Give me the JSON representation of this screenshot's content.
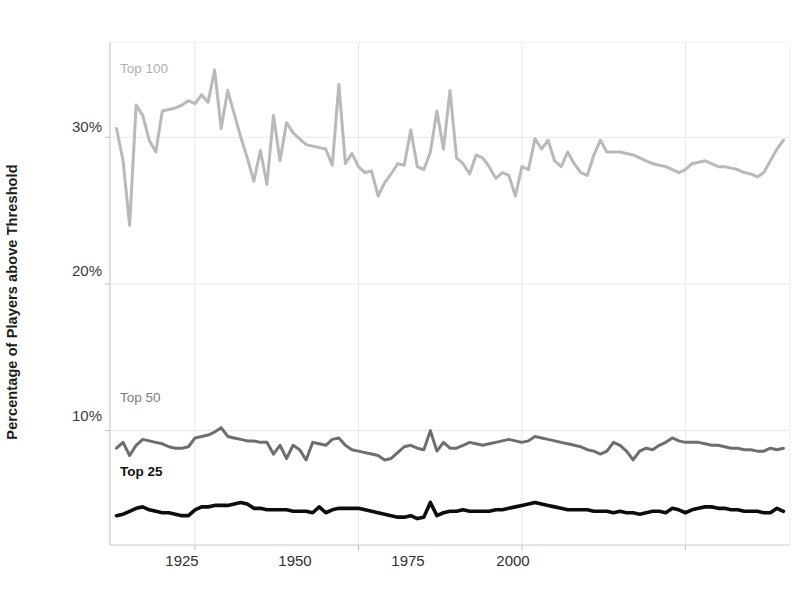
{
  "chart_data": {
    "type": "line",
    "title": "",
    "xlabel": "",
    "ylabel": "Percentage of Players above Threshold",
    "xlim": [
      1912,
      2016
    ],
    "ylim": [
      2.2,
      36.5
    ],
    "grid": true,
    "grid_axis": "both",
    "legend": "inline-labels",
    "xticks": [
      1925,
      1950,
      1975,
      2000
    ],
    "xticklabels": [
      "1925",
      "1950",
      "1975",
      "2000"
    ],
    "yticks": [
      10,
      20,
      30
    ],
    "yticklabels": [
      "10%",
      "20%",
      "30%"
    ],
    "x": [
      1913,
      1914,
      1915,
      1916,
      1917,
      1918,
      1919,
      1920,
      1921,
      1922,
      1923,
      1924,
      1925,
      1926,
      1927,
      1928,
      1929,
      1930,
      1931,
      1932,
      1933,
      1934,
      1935,
      1936,
      1937,
      1938,
      1939,
      1940,
      1941,
      1942,
      1943,
      1944,
      1945,
      1946,
      1947,
      1948,
      1949,
      1950,
      1951,
      1952,
      1953,
      1954,
      1955,
      1956,
      1957,
      1958,
      1959,
      1960,
      1961,
      1962,
      1963,
      1964,
      1965,
      1966,
      1967,
      1968,
      1969,
      1970,
      1971,
      1972,
      1973,
      1974,
      1975,
      1976,
      1977,
      1978,
      1979,
      1980,
      1981,
      1982,
      1983,
      1984,
      1985,
      1986,
      1987,
      1988,
      1989,
      1990,
      1991,
      1992,
      1993,
      1994,
      1995,
      1996,
      1997,
      1998,
      1999,
      2000,
      2001,
      2002,
      2003,
      2004,
      2005,
      2006,
      2007,
      2008,
      2009,
      2010,
      2011,
      2012,
      2013,
      2014,
      2015
    ],
    "series": [
      {
        "name": "Top 100",
        "color": "#b9b9b9",
        "label_x": 1916,
        "label_y": 34.2,
        "values": [
          30.6,
          28.4,
          24.0,
          32.2,
          31.5,
          29.8,
          29.0,
          31.8,
          31.9,
          32.0,
          32.2,
          32.5,
          32.3,
          32.9,
          32.4,
          34.6,
          30.6,
          33.2,
          31.6,
          30.0,
          28.6,
          27.0,
          29.1,
          26.8,
          31.5,
          28.4,
          31.0,
          30.3,
          29.9,
          29.5,
          29.4,
          29.3,
          29.2,
          28.1,
          33.6,
          28.2,
          28.9,
          28.0,
          27.6,
          27.7,
          26.0,
          26.9,
          27.5,
          28.2,
          28.1,
          30.5,
          28.0,
          27.8,
          29.0,
          31.8,
          29.2,
          33.2,
          28.6,
          28.2,
          27.5,
          28.8,
          28.6,
          28.0,
          27.2,
          27.6,
          27.4,
          26.0,
          28.0,
          27.8,
          29.9,
          29.2,
          29.8,
          28.4,
          28.0,
          29.0,
          28.2,
          27.6,
          27.4,
          28.8,
          29.8,
          29.0,
          29.0,
          29.0,
          28.9,
          28.8,
          28.6,
          28.4,
          28.2,
          28.1,
          28.0,
          27.8,
          27.6,
          27.8,
          28.2,
          28.3,
          28.4,
          28.2,
          28.0,
          28.0,
          27.9,
          27.8,
          27.6,
          27.5,
          27.3,
          27.6,
          28.4,
          29.2,
          29.8
        ]
      },
      {
        "name": "Top 50",
        "color": "#6e6e6e",
        "label_x": 1916,
        "label_y": 11.7,
        "values": [
          8.8,
          9.2,
          8.3,
          9.0,
          9.4,
          9.3,
          9.2,
          9.1,
          8.9,
          8.8,
          8.8,
          8.9,
          9.5,
          9.6,
          9.7,
          9.9,
          10.2,
          9.6,
          9.5,
          9.4,
          9.3,
          9.3,
          9.2,
          9.2,
          8.4,
          9.0,
          8.1,
          9.0,
          8.7,
          8.0,
          9.2,
          9.1,
          9.0,
          9.4,
          9.5,
          9.0,
          8.7,
          8.6,
          8.5,
          8.4,
          8.3,
          8.0,
          8.1,
          8.5,
          8.9,
          9.0,
          8.8,
          8.7,
          10.0,
          8.6,
          9.2,
          8.8,
          8.8,
          9.0,
          9.2,
          9.1,
          9.0,
          9.1,
          9.2,
          9.3,
          9.4,
          9.3,
          9.2,
          9.3,
          9.6,
          9.5,
          9.4,
          9.3,
          9.2,
          9.1,
          9.0,
          8.9,
          8.7,
          8.6,
          8.4,
          8.6,
          9.2,
          9.0,
          8.6,
          8.0,
          8.6,
          8.8,
          8.7,
          9.0,
          9.2,
          9.5,
          9.3,
          9.2,
          9.2,
          9.2,
          9.1,
          9.0,
          9.0,
          8.9,
          8.8,
          8.8,
          8.7,
          8.7,
          8.6,
          8.6,
          8.8,
          8.7,
          8.8
        ]
      },
      {
        "name": "Top 25",
        "color": "#0d0d0d",
        "label_x": 1916,
        "label_y": 6.6,
        "values": [
          4.2,
          4.3,
          4.5,
          4.7,
          4.8,
          4.6,
          4.5,
          4.4,
          4.4,
          4.3,
          4.2,
          4.2,
          4.6,
          4.8,
          4.8,
          4.9,
          4.9,
          4.9,
          5.0,
          5.1,
          5.0,
          4.7,
          4.7,
          4.6,
          4.6,
          4.6,
          4.6,
          4.5,
          4.5,
          4.5,
          4.4,
          4.8,
          4.4,
          4.6,
          4.7,
          4.7,
          4.7,
          4.7,
          4.6,
          4.5,
          4.4,
          4.3,
          4.2,
          4.1,
          4.1,
          4.2,
          4.0,
          4.1,
          5.1,
          4.2,
          4.4,
          4.5,
          4.5,
          4.6,
          4.5,
          4.5,
          4.5,
          4.5,
          4.6,
          4.6,
          4.7,
          4.8,
          4.9,
          5.0,
          5.1,
          5.0,
          4.9,
          4.8,
          4.7,
          4.6,
          4.6,
          4.6,
          4.6,
          4.5,
          4.5,
          4.5,
          4.4,
          4.5,
          4.4,
          4.4,
          4.3,
          4.4,
          4.5,
          4.5,
          4.4,
          4.7,
          4.6,
          4.4,
          4.6,
          4.7,
          4.8,
          4.8,
          4.7,
          4.7,
          4.6,
          4.6,
          4.5,
          4.5,
          4.5,
          4.4,
          4.4,
          4.7,
          4.5
        ]
      }
    ]
  },
  "axes": {
    "ylabel": "Percentage of Players above Threshold",
    "ytick_labels": [
      "30%",
      "20%",
      "10%"
    ],
    "xtick_labels": [
      "1925",
      "1950",
      "1975",
      "2000"
    ]
  },
  "labels": {
    "top100": "Top 100",
    "top50": "Top 50",
    "top25": "Top 25"
  },
  "colors": {
    "top100": "#b9b9b9",
    "top50": "#6e6e6e",
    "top25": "#0d0d0d",
    "grid": "#e8e8e8",
    "axis": "#d2d2d2",
    "text": "#2b2b2b"
  }
}
